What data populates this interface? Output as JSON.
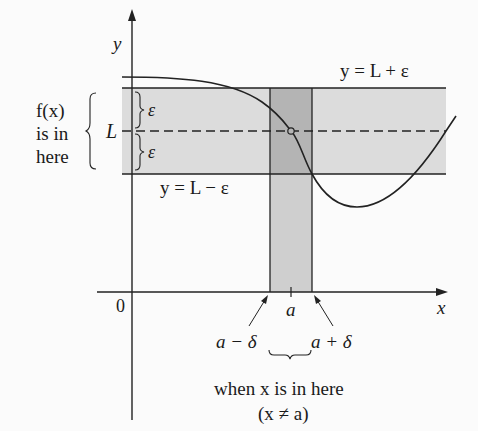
{
  "figure": {
    "axes": {
      "x_label": "x",
      "y_label": "y",
      "origin_label": "0"
    },
    "horizontal_lines": {
      "upper": "y = L + ε",
      "lower": "y = L − ε",
      "center": "L"
    },
    "epsilon_labels": [
      "ε",
      "ε"
    ],
    "left_annotation": [
      "f(x)",
      "is in",
      "here"
    ],
    "x_point": "a",
    "interval_labels": {
      "left": "a − δ",
      "right": "a + δ"
    },
    "bottom_annotation": [
      "when x is in here",
      "(x ≠ a)"
    ],
    "colors": {
      "band_fill": "#dcdcdc",
      "strip_fill": "#c8c8c8",
      "overlap_fill": "#aeaeae",
      "line": "#222222"
    }
  }
}
